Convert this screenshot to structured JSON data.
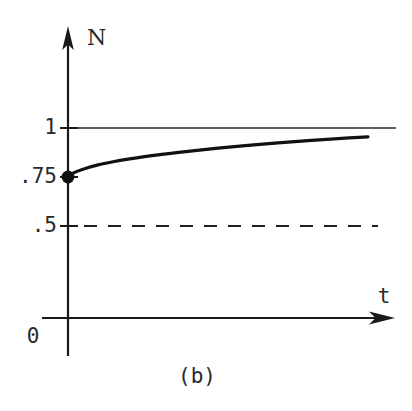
{
  "figure": {
    "caption": "(b)",
    "background_color": "#ffffff",
    "ink_color": "#1a1a1a"
  },
  "chart_data": {
    "type": "line",
    "title": "",
    "subtitle": "",
    "xlabel": "t",
    "ylabel": "N",
    "origin_label": "0",
    "xlim": [
      0,
      1
    ],
    "ylim": [
      0,
      1.12
    ],
    "grid": false,
    "legend": null,
    "ytick_labels": [
      "1",
      ".75",
      ".5"
    ],
    "ytick_values": [
      1,
      0.75,
      0.5
    ],
    "xtick_labels": [],
    "series": [
      {
        "name": "N(t)",
        "style": "solid",
        "marker_at_start": true,
        "start_value": 0.75,
        "end_value": 0.955,
        "asymptote": 1,
        "x": [
          0.0,
          0.02,
          0.05,
          0.1,
          0.15,
          0.2,
          0.3,
          0.4,
          0.5,
          0.6,
          0.7,
          0.8,
          0.9,
          1.0
        ],
        "values": [
          0.75,
          0.772,
          0.79,
          0.812,
          0.828,
          0.841,
          0.863,
          0.881,
          0.897,
          0.911,
          0.924,
          0.936,
          0.946,
          0.955
        ]
      }
    ],
    "reference_lines": [
      {
        "name": "carrying-capacity",
        "value": 1,
        "style": "solid",
        "orientation": "horizontal"
      },
      {
        "name": "half-capacity",
        "value": 0.5,
        "style": "dashed",
        "orientation": "horizontal"
      }
    ],
    "annotations": [
      {
        "name": "initial-condition-point",
        "x": 0,
        "y": 0.75,
        "label": ".75"
      }
    ]
  }
}
